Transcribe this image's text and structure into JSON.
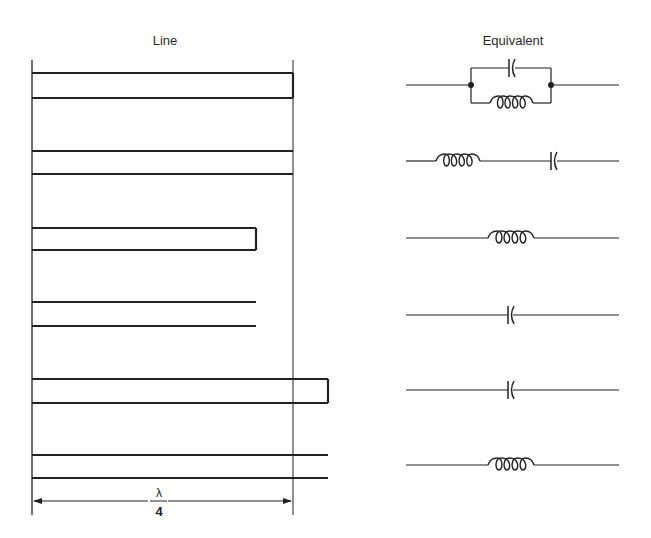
{
  "headings": {
    "line": "Line",
    "equivalent": "Equivalent"
  },
  "dimension": {
    "numerator": "λ",
    "denominator": "4",
    "label": "λ/4"
  },
  "colors": {
    "stroke": "#222222",
    "background": "#ffffff"
  },
  "reference_lines": {
    "x_left": 32,
    "x_right": 293,
    "y_top": 60,
    "y_bottom": 515
  },
  "rows": [
    {
      "line_type": "shorted",
      "line_end_x": 293,
      "y_top": 73,
      "y_bot": 98,
      "equivalent": "parallel LC",
      "wire_y": 85
    },
    {
      "line_type": "open",
      "line_end_x": 293,
      "y_top": 151,
      "y_bot": 174,
      "equivalent": "series LC",
      "wire_y": 161
    },
    {
      "line_type": "shorted",
      "line_end_x": 256,
      "y_top": 228,
      "y_bot": 250,
      "equivalent": "inductor",
      "wire_y": 238
    },
    {
      "line_type": "open",
      "line_end_x": 256,
      "y_top": 302,
      "y_bot": 326,
      "equivalent": "capacitor",
      "wire_y": 315
    },
    {
      "line_type": "shorted",
      "line_end_x": 328,
      "y_top": 379,
      "y_bot": 403,
      "equivalent": "capacitor",
      "wire_y": 390
    },
    {
      "line_type": "open",
      "line_end_x": 328,
      "y_top": 455,
      "y_bot": 478,
      "equivalent": "inductor",
      "wire_y": 465
    }
  ]
}
